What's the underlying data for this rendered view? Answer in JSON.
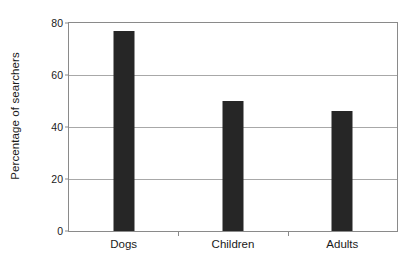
{
  "chart_data": {
    "type": "bar",
    "title": "",
    "subtitle": "",
    "xlabel": "",
    "ylabel": "Percentage of searchers",
    "categories": [
      "Dogs",
      "Children",
      "Adults"
    ],
    "values": [
      77,
      50,
      46
    ],
    "series": [
      {
        "name": "Percentage of searchers",
        "values": [
          77,
          50,
          46
        ]
      }
    ],
    "ylim": [
      0,
      80
    ],
    "yticks": [
      0,
      20,
      40,
      60,
      80
    ],
    "ytick_labels": [
      "0",
      "20",
      "40",
      "60",
      "80"
    ],
    "grid": "horizontal",
    "legend": "none",
    "orientation": "vertical",
    "bar_color": "#262626",
    "axis_color": "#8a8a8a",
    "grid_color": "#a8a8a8",
    "background_color": "#ffffff",
    "annotations": []
  }
}
